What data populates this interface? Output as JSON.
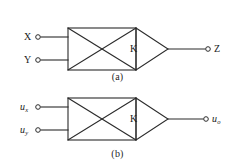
{
  "figure": {
    "type": "circuit-block-diagram",
    "stroke_color": "#2b2b2b",
    "background_color": "#ffffff",
    "panels": [
      {
        "id": "a",
        "caption": "(a)",
        "gain_label": "K",
        "inputs": [
          {
            "label": "X",
            "italic": false,
            "subscript": ""
          },
          {
            "label": "Y",
            "italic": false,
            "subscript": ""
          }
        ],
        "outputs": [
          {
            "label": "Z",
            "italic": false,
            "subscript": ""
          }
        ]
      },
      {
        "id": "b",
        "caption": "(b)",
        "gain_label": "K",
        "inputs": [
          {
            "label": "u",
            "italic": true,
            "subscript": "x"
          },
          {
            "label": "u",
            "italic": true,
            "subscript": "y"
          }
        ],
        "outputs": [
          {
            "label": "u",
            "italic": true,
            "subscript": "o"
          }
        ]
      }
    ]
  }
}
